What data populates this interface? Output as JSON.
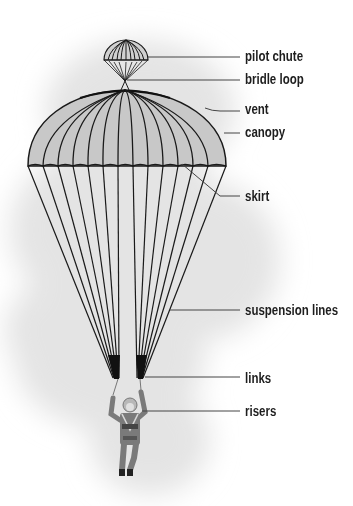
{
  "diagram": {
    "type": "labeled-illustration",
    "colors": {
      "canopy_fill": "#c8c8c8",
      "line": "#1a1a1a",
      "leader": "#444444",
      "background_cloud": "#e6e6e6",
      "jumper": "#7a7a7a"
    },
    "labels": [
      {
        "id": "pilot-chute",
        "text": "pilot chute"
      },
      {
        "id": "bridle-loop",
        "text": "bridle loop"
      },
      {
        "id": "vent",
        "text": "vent"
      },
      {
        "id": "canopy",
        "text": "canopy"
      },
      {
        "id": "skirt",
        "text": "skirt"
      },
      {
        "id": "suspension-lines",
        "text": "suspension lines"
      },
      {
        "id": "links",
        "text": "links"
      },
      {
        "id": "risers",
        "text": "risers"
      }
    ]
  }
}
